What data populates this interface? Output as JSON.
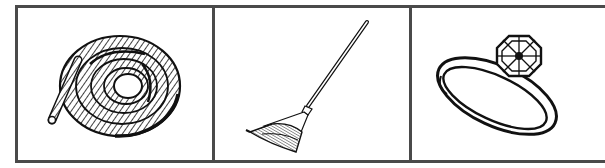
{
  "figure": {
    "panels": [
      {
        "id": "panel-1",
        "object": "rope",
        "icon": "coiled-rope-icon",
        "label": "Rope"
      },
      {
        "id": "panel-2",
        "object": "rake",
        "icon": "leaf-rake-icon",
        "label": "Rake"
      },
      {
        "id": "panel-3",
        "object": "ring",
        "icon": "diamond-ring-icon",
        "label": "Ring"
      }
    ],
    "colors": {
      "border": "#4a4a4a",
      "ink": "#111111",
      "background": "#ffffff"
    }
  }
}
